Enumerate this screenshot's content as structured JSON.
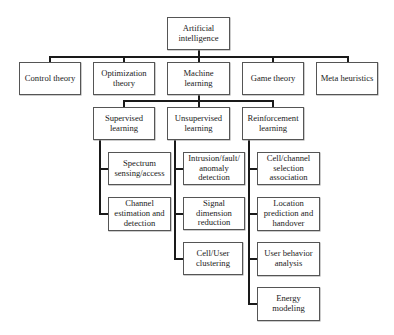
{
  "diagram": {
    "type": "hierarchy tree",
    "root": {
      "label": "Artificial\nintelligence"
    },
    "level1": [
      {
        "label": "Control theory"
      },
      {
        "label": "Optimization\ntheory"
      },
      {
        "label": "Machine\nlearning"
      },
      {
        "label": "Game theory"
      },
      {
        "label": "Meta heuristics"
      }
    ],
    "ml_children": [
      {
        "label": "Supervised\nlearning",
        "children": [
          {
            "label": "Spectrum\nsensing/access"
          },
          {
            "label": "Channel\nestimation and\ndetection"
          }
        ]
      },
      {
        "label": "Unsupervised\nlearning",
        "children": [
          {
            "label": "Intrusion/fault/\nanomaly\ndetection"
          },
          {
            "label": "Signal\ndimension\nreduction"
          },
          {
            "label": "Cell/User\nclustering"
          }
        ]
      },
      {
        "label": "Reinforcement\nlearning",
        "children": [
          {
            "label": "Cell/channel\nselection\nassociation"
          },
          {
            "label": "Location\nprediction and\nhandover"
          },
          {
            "label": "User behavior\nanalysis"
          },
          {
            "label": "Energy\nmodeling"
          }
        ]
      }
    ]
  }
}
